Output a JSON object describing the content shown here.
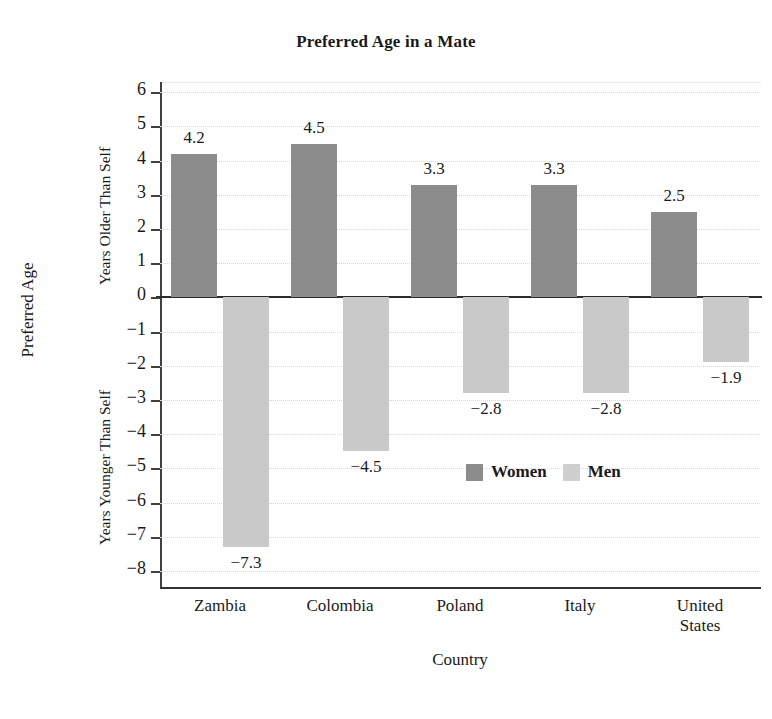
{
  "chart_data": {
    "type": "bar",
    "title": "Preferred Age in a Mate",
    "xlabel": "Country",
    "ylabel": "Preferred Age",
    "ylabel_upper": "Years Older Than Self",
    "ylabel_lower": "Years Younger Than Self",
    "categories": [
      "Zambia",
      "Colombia",
      "Poland",
      "Italy",
      "United\nStates"
    ],
    "series": [
      {
        "name": "Women",
        "color": "#8c8c8c",
        "values": [
          4.2,
          4.5,
          3.3,
          3.3,
          2.5
        ]
      },
      {
        "name": "Men",
        "color": "#c9c9c9",
        "values": [
          -7.3,
          -4.5,
          -2.8,
          -2.8,
          -1.9
        ]
      }
    ],
    "value_labels": {
      "women": [
        "4.2",
        "4.5",
        "3.3",
        "3.3",
        "2.5"
      ],
      "men": [
        "−7.3",
        "−4.5",
        "−2.8",
        "−2.8",
        "−1.9"
      ]
    },
    "ylim": [
      -8.5,
      6.3
    ],
    "yticks": [
      6,
      5,
      4,
      3,
      2,
      1,
      0,
      -1,
      -2,
      -3,
      -4,
      -5,
      -6,
      -7,
      -8
    ],
    "ytick_labels": [
      "6",
      "5",
      "4",
      "3",
      "2",
      "1",
      "0",
      "−1",
      "−2",
      "−3",
      "−4",
      "−5",
      "−6",
      "−7",
      "−8"
    ],
    "grid": true,
    "grid_style": "dotted",
    "legend_position": "inside-lower-right",
    "legend": [
      "Women",
      "Men"
    ]
  }
}
